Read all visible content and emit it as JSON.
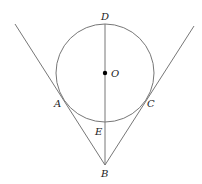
{
  "diagram": {
    "type": "geometry",
    "colors": {
      "stroke": "#777777",
      "point": "#000000",
      "label": "#222222"
    },
    "circle": {
      "center": "O",
      "cx": 105,
      "cy": 73,
      "r": 49
    },
    "points": {
      "D": {
        "label": "D",
        "x": 105,
        "y": 24
      },
      "O": {
        "label": "O",
        "x": 105,
        "y": 73
      },
      "A": {
        "label": "A",
        "x": 62,
        "y": 97
      },
      "C": {
        "label": "C",
        "x": 148,
        "y": 97
      },
      "E": {
        "label": "E",
        "x": 105,
        "y": 122
      },
      "B": {
        "label": "B",
        "x": 105,
        "y": 165
      }
    },
    "segments": [
      {
        "name": "tangent-line-BA",
        "from": "B",
        "to": "beyond A"
      },
      {
        "name": "tangent-line-BC",
        "from": "B",
        "to": "beyond C"
      },
      {
        "name": "line-BD",
        "from": "B",
        "to": "D"
      }
    ]
  }
}
